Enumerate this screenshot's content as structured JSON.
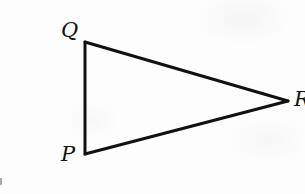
{
  "figure": {
    "background_color": "#fdfdfd",
    "stroke_color": "#111111",
    "stroke_width": 3,
    "width": 305,
    "height": 194,
    "shape": "triangle",
    "vertices": [
      {
        "label": "Q",
        "x": 85,
        "y": 42,
        "label_x": 61,
        "label_y": 20
      },
      {
        "label": "P",
        "x": 85,
        "y": 154,
        "label_x": 61,
        "label_y": 144
      },
      {
        "label": "R",
        "x": 288,
        "y": 101,
        "label_x": 294,
        "label_y": 89
      }
    ],
    "edges": [
      {
        "name": "edge-qp",
        "from": "Q",
        "to": "P"
      },
      {
        "name": "edge-qr",
        "from": "Q",
        "to": "R"
      },
      {
        "name": "edge-pr",
        "from": "P",
        "to": "R"
      }
    ],
    "artifacts": {
      "left_edge_speck": "visible"
    }
  }
}
